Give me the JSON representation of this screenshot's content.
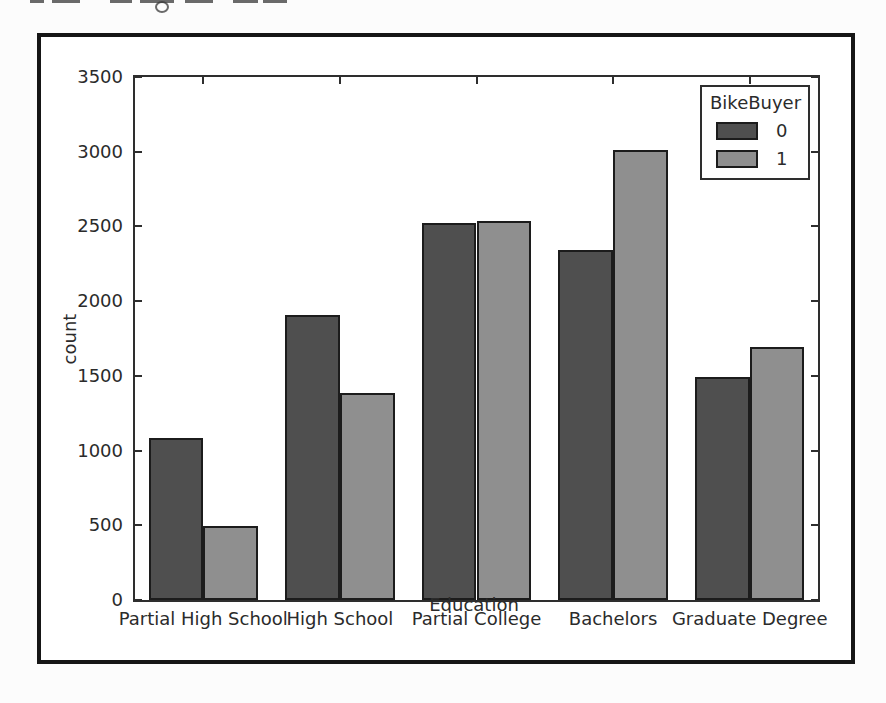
{
  "figure": {
    "frame_color": "#161616",
    "background": "#ffffff"
  },
  "chart_data": {
    "type": "bar",
    "categories": [
      "Partial High School",
      "High School",
      "Partial College",
      "Bachelors",
      "Graduate Degree"
    ],
    "series": [
      {
        "name": "0",
        "color": "#4f4f4f",
        "values": [
          1085,
          1908,
          2526,
          2343,
          1494
        ]
      },
      {
        "name": "1",
        "color": "#8f8f8f",
        "values": [
          496,
          1386,
          2538,
          3013,
          1695
        ]
      }
    ],
    "xlabel": "Education",
    "ylabel": "count",
    "ylim": [
      0,
      3500
    ],
    "yticks": [
      0,
      500,
      1000,
      1500,
      2000,
      2500,
      3000,
      3500
    ],
    "legend": {
      "title": "BikeBuyer",
      "position": "upper-right"
    },
    "grid": false,
    "bar_edge_color": "#1c1c1c"
  }
}
